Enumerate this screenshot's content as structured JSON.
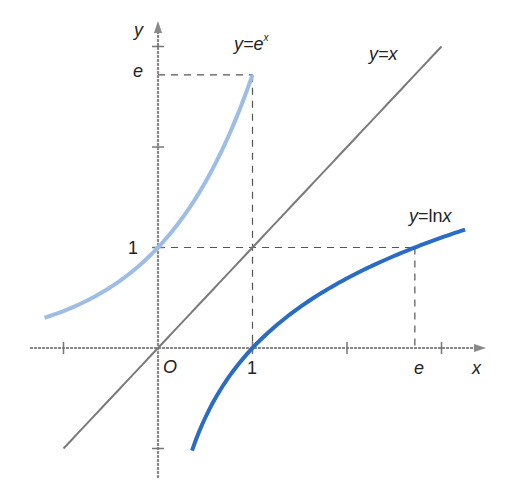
{
  "figure": {
    "type": "function-graph"
  },
  "axes": {
    "x_label": "x",
    "y_label": "y",
    "origin_label": "O",
    "x_tick_labels": [
      {
        "value": 1,
        "text": "1"
      },
      {
        "value": 2.718,
        "text": "e"
      }
    ],
    "y_tick_labels": [
      {
        "value": 1,
        "text": "1"
      },
      {
        "value": 2.718,
        "text": "e"
      }
    ],
    "x_ticks": [
      -1,
      1,
      2,
      3
    ],
    "y_ticks": [
      -1,
      1,
      2,
      3
    ],
    "x_range": [
      -1.35,
      3.45
    ],
    "y_range": [
      -1.2,
      3.25
    ]
  },
  "curves": [
    {
      "id": "exp",
      "label": "y=e",
      "label_sup": "x",
      "color": "#9dbde6",
      "domain": [
        -1.2,
        1
      ]
    },
    {
      "id": "identity",
      "label": "y=x",
      "color": "#7a7a7a",
      "domain": [
        -1,
        3
      ]
    },
    {
      "id": "ln",
      "label": "y=lnx",
      "color": "#2a6cc4",
      "domain": [
        0.36,
        3.25
      ]
    }
  ],
  "guides": [
    {
      "from": [
        0,
        2.718
      ],
      "to": [
        1,
        2.718
      ]
    },
    {
      "from": [
        1,
        2.718
      ],
      "to": [
        1,
        0
      ]
    },
    {
      "from": [
        0,
        1
      ],
      "to": [
        2.718,
        1
      ]
    },
    {
      "from": [
        2.718,
        1
      ],
      "to": [
        2.718,
        0
      ]
    }
  ],
  "chart_data": {
    "type": "line",
    "title": "",
    "xlabel": "x",
    "ylabel": "y",
    "xlim": [
      -1.35,
      3.45
    ],
    "ylim": [
      -1.2,
      3.25
    ],
    "grid": false,
    "legend": "inline labels",
    "series": [
      {
        "name": "y=e^x",
        "x": [
          -1.2,
          -1,
          -0.5,
          0,
          0.5,
          1
        ],
        "y": [
          0.301,
          0.368,
          0.607,
          1,
          1.649,
          2.718
        ]
      },
      {
        "name": "y=x",
        "x": [
          -1,
          3
        ],
        "y": [
          -1,
          3
        ]
      },
      {
        "name": "y=ln x",
        "x": [
          0.36,
          0.5,
          1,
          1.5,
          2,
          2.718,
          3.25
        ],
        "y": [
          -1.02,
          -0.693,
          0,
          0.405,
          0.693,
          1,
          1.179
        ]
      }
    ],
    "annotations": [
      "O",
      "1 (x-axis)",
      "e (x-axis)",
      "1 (y-axis)",
      "e (y-axis)",
      "dashed guides at (1,e) and (e,1)"
    ]
  }
}
